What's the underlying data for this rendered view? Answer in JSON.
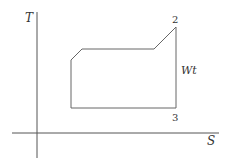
{
  "diagram": {
    "type": "T-S diagram",
    "axes": {
      "y_label": "T",
      "x_label": "S"
    },
    "points": {
      "p2": "2",
      "p3": "3"
    },
    "annotation": "Wt",
    "colors": {
      "line": "#555555",
      "background": "#ffffff"
    }
  }
}
